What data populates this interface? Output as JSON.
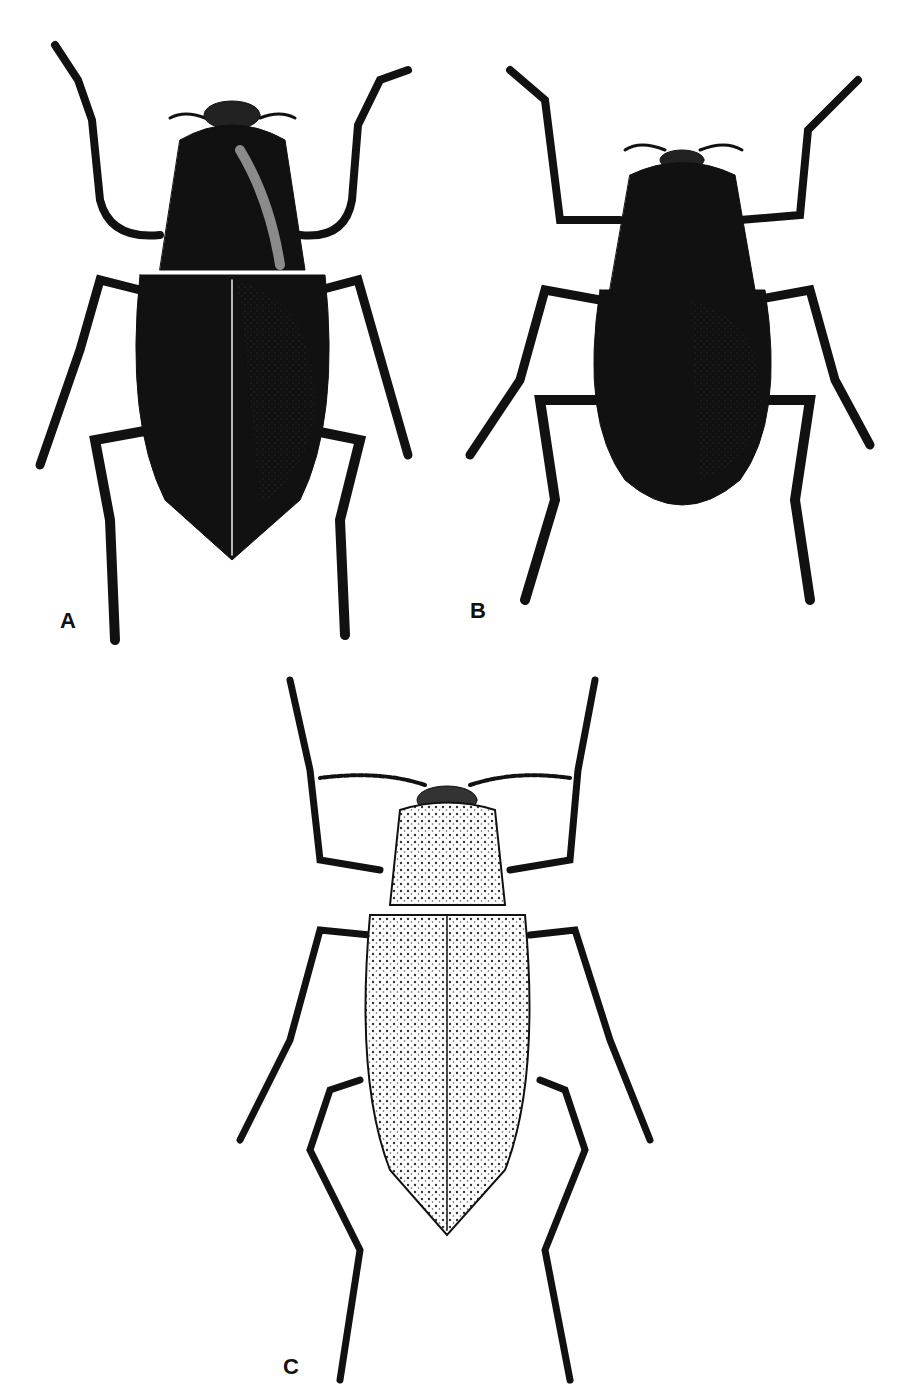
{
  "plate": {
    "figures": [
      {
        "id": "A",
        "label": "A",
        "style": "dark glossy beetle, punctate elytra"
      },
      {
        "id": "B",
        "label": "B",
        "style": "dark glossy beetle, smaller, rounded elytra"
      },
      {
        "id": "C",
        "label": "C",
        "style": "light stippled beetle, long legs, beaded antennae"
      }
    ]
  },
  "colors": {
    "ink": "#111111",
    "paper": "#ffffff",
    "stipple": "#555555"
  }
}
